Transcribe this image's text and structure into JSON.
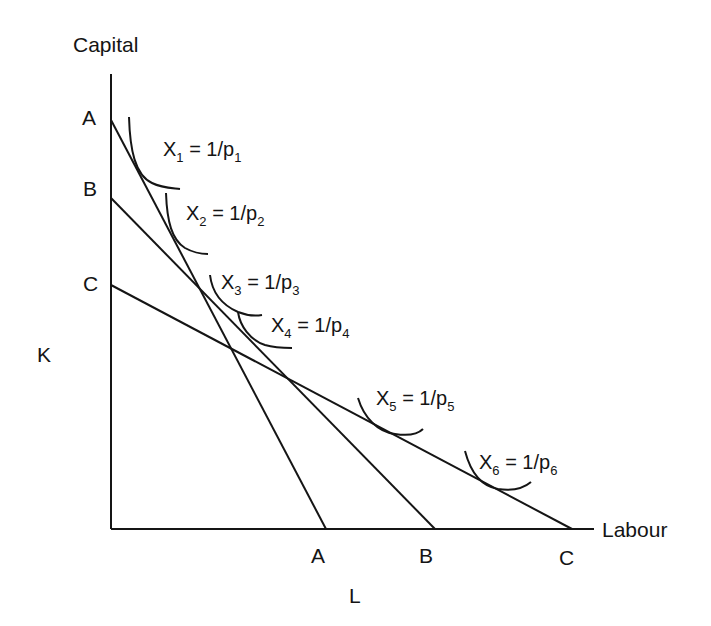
{
  "diagram": {
    "y_axis_label": "Capital",
    "x_axis_label": "Labour",
    "side_label_k": "K",
    "bottom_label_l": "L",
    "budget_lines": [
      {
        "name": "A",
        "k_label": "A",
        "l_label": "A"
      },
      {
        "name": "B",
        "k_label": "B",
        "l_label": "B"
      },
      {
        "name": "C",
        "k_label": "C",
        "l_label": "C"
      }
    ],
    "isoquants": [
      {
        "var": "X",
        "sub": "1",
        "eq": " = 1/p",
        "psub": "1"
      },
      {
        "var": "X",
        "sub": "2",
        "eq": " = 1/p",
        "psub": "2"
      },
      {
        "var": "X",
        "sub": "3",
        "eq": " = 1/p",
        "psub": "3"
      },
      {
        "var": "X",
        "sub": "4",
        "eq": " = 1/p",
        "psub": "4"
      },
      {
        "var": "X",
        "sub": "5",
        "eq": " = 1/p",
        "psub": "5"
      },
      {
        "var": "X",
        "sub": "6",
        "eq": " = 1/p",
        "psub": "6"
      }
    ],
    "colors": {
      "line": "#151515",
      "background": "#ffffff"
    }
  }
}
